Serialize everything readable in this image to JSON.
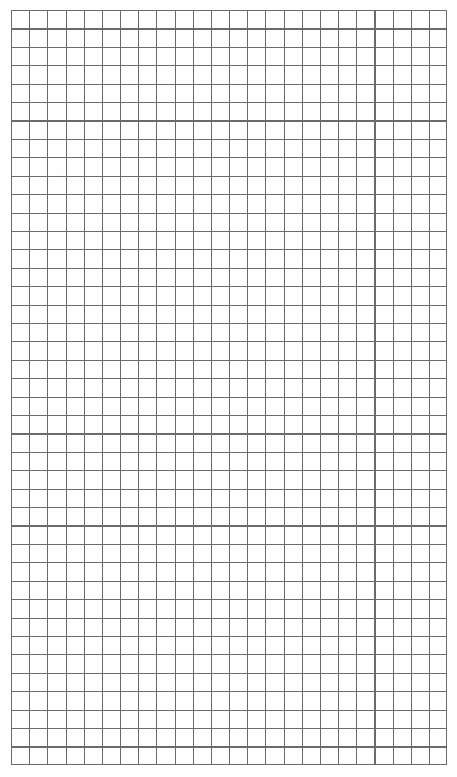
{
  "document": {
    "kind": "grid-paper-scan",
    "title": "Blank graph paper sheet",
    "visible_text": "",
    "page": {
      "width_px": 457,
      "height_px": 777,
      "background_color": "#ffffff"
    }
  },
  "grid": {
    "name": "square-grid",
    "origin_x_px": 11,
    "origin_y_px": 10,
    "width_px": 436,
    "height_px": 755,
    "columns": 24,
    "rows": 41,
    "cell_width_px": 18.17,
    "cell_height_px": 18.41,
    "line_color": "#6b6b6b",
    "line_width_px": 1.1,
    "border_color": "#6b6b6b",
    "paper_color": "#fefefe"
  }
}
